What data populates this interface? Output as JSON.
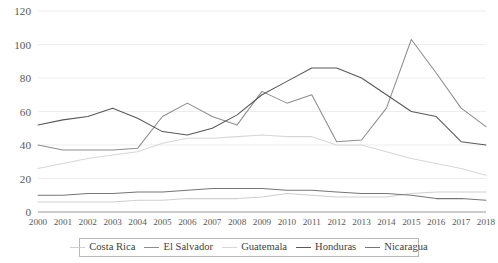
{
  "chart_data": {
    "type": "line",
    "title": "",
    "subtitle": "",
    "xlabel": "",
    "ylabel": "",
    "grid": true,
    "legend_position": "bottom",
    "xlim": [
      2000,
      2018
    ],
    "ylim": [
      0,
      120
    ],
    "yticks": [
      0,
      20,
      40,
      60,
      80,
      100,
      120
    ],
    "x": [
      2000,
      2001,
      2002,
      2003,
      2004,
      2005,
      2006,
      2007,
      2008,
      2009,
      2010,
      2011,
      2012,
      2013,
      2014,
      2015,
      2016,
      2017,
      2018
    ],
    "categories": [
      "2000",
      "2001",
      "2002",
      "2003",
      "2004",
      "2005",
      "2006",
      "2007",
      "2008",
      "2009",
      "2010",
      "2011",
      "2012",
      "2013",
      "2014",
      "2015",
      "2016",
      "2017",
      "2018"
    ],
    "series": [
      {
        "name": "Costa Rica",
        "color": "#cfcfd2",
        "values": [
          6,
          6,
          6,
          6,
          7,
          7,
          8,
          8,
          8,
          9,
          11,
          10,
          9,
          9,
          9,
          11,
          12,
          12,
          12
        ]
      },
      {
        "name": "El Salvador",
        "color": "#8d8d90",
        "values": [
          40,
          37,
          37,
          37,
          38,
          57,
          65,
          57,
          52,
          72,
          65,
          70,
          42,
          43,
          62,
          103,
          83,
          62,
          51
        ]
      },
      {
        "name": "Guatemala",
        "color": "#d7d7da",
        "values": [
          26,
          29,
          32,
          34,
          36,
          41,
          44,
          44,
          45,
          46,
          45,
          45,
          40,
          40,
          36,
          32,
          29,
          26,
          22
        ]
      },
      {
        "name": "Honduras",
        "color": "#58585b",
        "values": [
          52,
          55,
          57,
          62,
          56,
          48,
          46,
          50,
          58,
          70,
          78,
          86,
          86,
          80,
          70,
          60,
          57,
          42,
          40
        ]
      },
      {
        "name": "Nicaragua",
        "color": "#76767a",
        "values": [
          10,
          10,
          11,
          11,
          12,
          12,
          13,
          14,
          14,
          14,
          13,
          13,
          12,
          11,
          11,
          10,
          8,
          8,
          7
        ]
      }
    ]
  },
  "legend": {
    "items": [
      {
        "label": "Costa Rica"
      },
      {
        "label": "El Salvador"
      },
      {
        "label": "Guatemala"
      },
      {
        "label": "Honduras"
      },
      {
        "label": "Nicaragua"
      }
    ]
  }
}
